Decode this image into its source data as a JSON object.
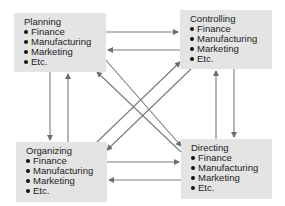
{
  "diagram": {
    "nodes": [
      {
        "id": "planning",
        "title": "Planning",
        "items": [
          "Finance",
          "Manufacturing",
          "Marketing",
          "Etc."
        ]
      },
      {
        "id": "controlling",
        "title": "Controlling",
        "items": [
          "Finance",
          "Manufacturing",
          "Marketing",
          "Etc."
        ]
      },
      {
        "id": "organizing",
        "title": "Organizing",
        "items": [
          "Finance",
          "Manufacturing",
          "Marketing",
          "Etc."
        ]
      },
      {
        "id": "directing",
        "title": "Directing",
        "items": [
          "Finance",
          "Manufacturing",
          "Marketing",
          "Etc."
        ]
      }
    ],
    "edges": [
      {
        "from": "planning",
        "to": "controlling"
      },
      {
        "from": "controlling",
        "to": "planning"
      },
      {
        "from": "organizing",
        "to": "directing"
      },
      {
        "from": "directing",
        "to": "organizing"
      },
      {
        "from": "planning",
        "to": "organizing"
      },
      {
        "from": "organizing",
        "to": "planning"
      },
      {
        "from": "controlling",
        "to": "directing"
      },
      {
        "from": "directing",
        "to": "controlling"
      },
      {
        "from": "planning",
        "to": "directing"
      },
      {
        "from": "directing",
        "to": "planning"
      },
      {
        "from": "organizing",
        "to": "controlling"
      },
      {
        "from": "controlling",
        "to": "organizing"
      }
    ],
    "colors": {
      "box_fill": "#e4e4e4",
      "arrow": "#6e6e6e",
      "text": "#222222"
    }
  }
}
